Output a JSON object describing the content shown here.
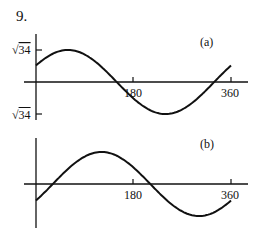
{
  "problem": {
    "number": "9."
  },
  "chart_data": [
    {
      "type": "line",
      "title": "(a)",
      "xlabel": "",
      "ylabel": "",
      "x_ticks": [
        180,
        360
      ],
      "x_tick_labels": [
        "180",
        "360"
      ],
      "y_ticks": [
        "√34",
        "-√34"
      ],
      "y_tick_labels": [
        "√34",
        "√34"
      ],
      "xlim": [
        0,
        400
      ],
      "ylim": [
        -5.831,
        5.831
      ],
      "grid": false,
      "series": [
        {
          "name": "y = √34 sin(x + 31°)",
          "x": [
            0,
            30,
            59,
            90,
            149,
            180,
            239,
            270,
            329,
            360
          ],
          "y": [
            3.0,
            4.6,
            5.83,
            5.0,
            0.0,
            -3.0,
            -5.83,
            -5.0,
            0.0,
            3.0
          ]
        }
      ]
    },
    {
      "type": "line",
      "title": "(b)",
      "xlabel": "",
      "ylabel": "",
      "x_ticks": [
        180,
        360
      ],
      "x_tick_labels": [
        "180",
        "360"
      ],
      "xlim": [
        0,
        400
      ],
      "ylim": [
        -5.831,
        5.831
      ],
      "grid": false,
      "series": [
        {
          "name": "y = √34 sin(x − 31°)",
          "x": [
            0,
            31,
            90,
            121,
            180,
            211,
            270,
            301,
            360
          ],
          "y": [
            -3.0,
            0.0,
            5.0,
            5.83,
            3.0,
            0.0,
            -5.0,
            -5.83,
            -3.0
          ]
        }
      ]
    }
  ]
}
